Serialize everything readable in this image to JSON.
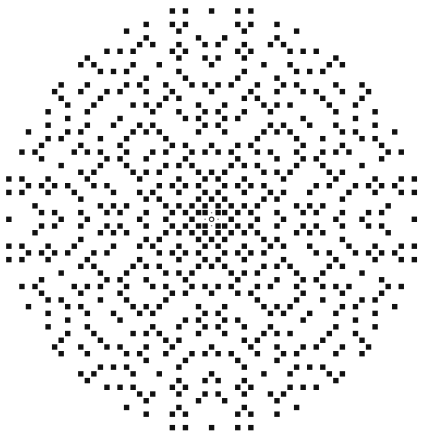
{
  "figure": {
    "background": "#ffffff",
    "dot_color": "#111111",
    "origin_marker_color": "#333333",
    "caption": ""
  },
  "chart_data": {
    "type": "scatter",
    "title": "",
    "xlabel": "",
    "ylabel": "",
    "rule": "gaussian_prime",
    "norm_limit": 1000,
    "xlim": [
      -31,
      31
    ],
    "ylim": [
      -31,
      31
    ],
    "grid": false,
    "legend": null,
    "marker": "square",
    "origin_marker": "ring",
    "layout": {
      "origin_px": [
        211.6,
        219.3
      ],
      "pitch_x_px": 6.54,
      "pitch_y_px": 6.72,
      "dot_size_px": 5.4
    },
    "sample_points_verified": [
      [
        0,
        31
      ],
      [
        4,
        31
      ],
      [
        -4,
        31
      ],
      [
        6,
        31
      ],
      [
        -6,
        31
      ],
      [
        31,
        0
      ],
      [
        -31,
        0
      ],
      [
        31,
        4
      ],
      [
        31,
        6
      ],
      [
        13,
        28
      ],
      [
        28,
        13
      ],
      [
        25,
        16
      ],
      [
        29,
        6
      ],
      [
        29,
        10
      ],
      [
        1,
        1
      ],
      [
        -1,
        1
      ],
      [
        1,
        -1
      ],
      [
        -1,
        -1
      ],
      [
        3,
        0
      ],
      [
        0,
        3
      ]
    ]
  }
}
